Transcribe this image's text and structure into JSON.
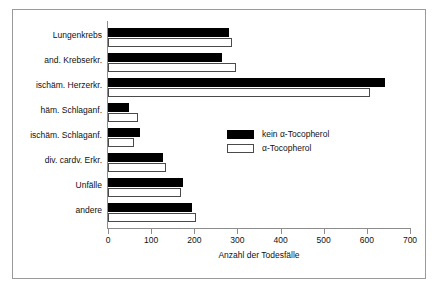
{
  "chart_data": {
    "type": "bar",
    "orientation": "horizontal",
    "title": "",
    "xlabel": "Anzahl der Todesfälle",
    "ylabel": "",
    "xlim": [
      0,
      700
    ],
    "xticks": [
      0,
      100,
      200,
      300,
      400,
      500,
      600,
      700
    ],
    "xtick_labels": [
      "0",
      "100",
      "200",
      "300",
      "400",
      "500",
      "600",
      "700"
    ],
    "grid": false,
    "legend_position": "center-right",
    "categories": [
      "Lungenkrebs",
      "and. Krebserkr.",
      "ischäm. Herzerkr.",
      "häm. Schlaganf.",
      "ischäm. Schlaganf.",
      "div. cardv. Erkr.",
      "Unfälle",
      "andere"
    ],
    "series": [
      {
        "name": "kein α-Tocopherol",
        "color": "#000000",
        "values": [
          281,
          265,
          643,
          49,
          74,
          128,
          174,
          195
        ]
      },
      {
        "name": "α-Tocopherol",
        "color": "#ffffff",
        "values": [
          288,
          297,
          608,
          70,
          60,
          134,
          169,
          204
        ]
      }
    ]
  },
  "legend": {
    "entries": [
      {
        "label": "kein α-Tocopherol",
        "swatch": "black"
      },
      {
        "label": "α-Tocopherol",
        "swatch": "white"
      }
    ]
  },
  "colors": {
    "frame": "#9a9a9a",
    "axis": "#8d8d8d",
    "text": "#111111",
    "bar_filled": "#000000",
    "bar_open_border": "#4a4a4a"
  }
}
